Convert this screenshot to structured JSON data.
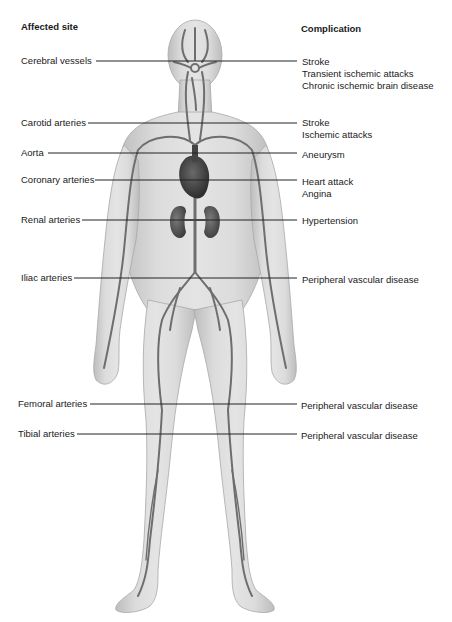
{
  "headers": {
    "affected_site": "Affected site",
    "complication": "Complication"
  },
  "rows": [
    {
      "site": "Cerebral vessels",
      "complications": [
        "Stroke",
        "Transient ischemic attacks",
        "Chronic ischemic brain disease"
      ]
    },
    {
      "site": "Carotid arteries",
      "complications": [
        "Stroke",
        "Ischemic attacks"
      ]
    },
    {
      "site": "Aorta",
      "complications": [
        "Aneurysm"
      ]
    },
    {
      "site": "Coronary arteries",
      "complications": [
        "Heart attack",
        "Angina"
      ]
    },
    {
      "site": "Renal arteries",
      "complications": [
        "Hypertension"
      ]
    },
    {
      "site": "Iliac arteries",
      "complications": [
        "Peripheral vascular disease"
      ]
    },
    {
      "site": "Femoral arteries",
      "complications": [
        "Peripheral vascular disease"
      ]
    },
    {
      "site": "Tibial arteries",
      "complications": [
        "Peripheral vascular disease"
      ]
    }
  ],
  "colors": {
    "body_fill": "#d9d9d9",
    "body_shade": "#b8b8b8",
    "artery": "#6e6e6e",
    "organ": "#4a4a4a",
    "leader_line": "#222222",
    "text": "#1a1a1a"
  }
}
